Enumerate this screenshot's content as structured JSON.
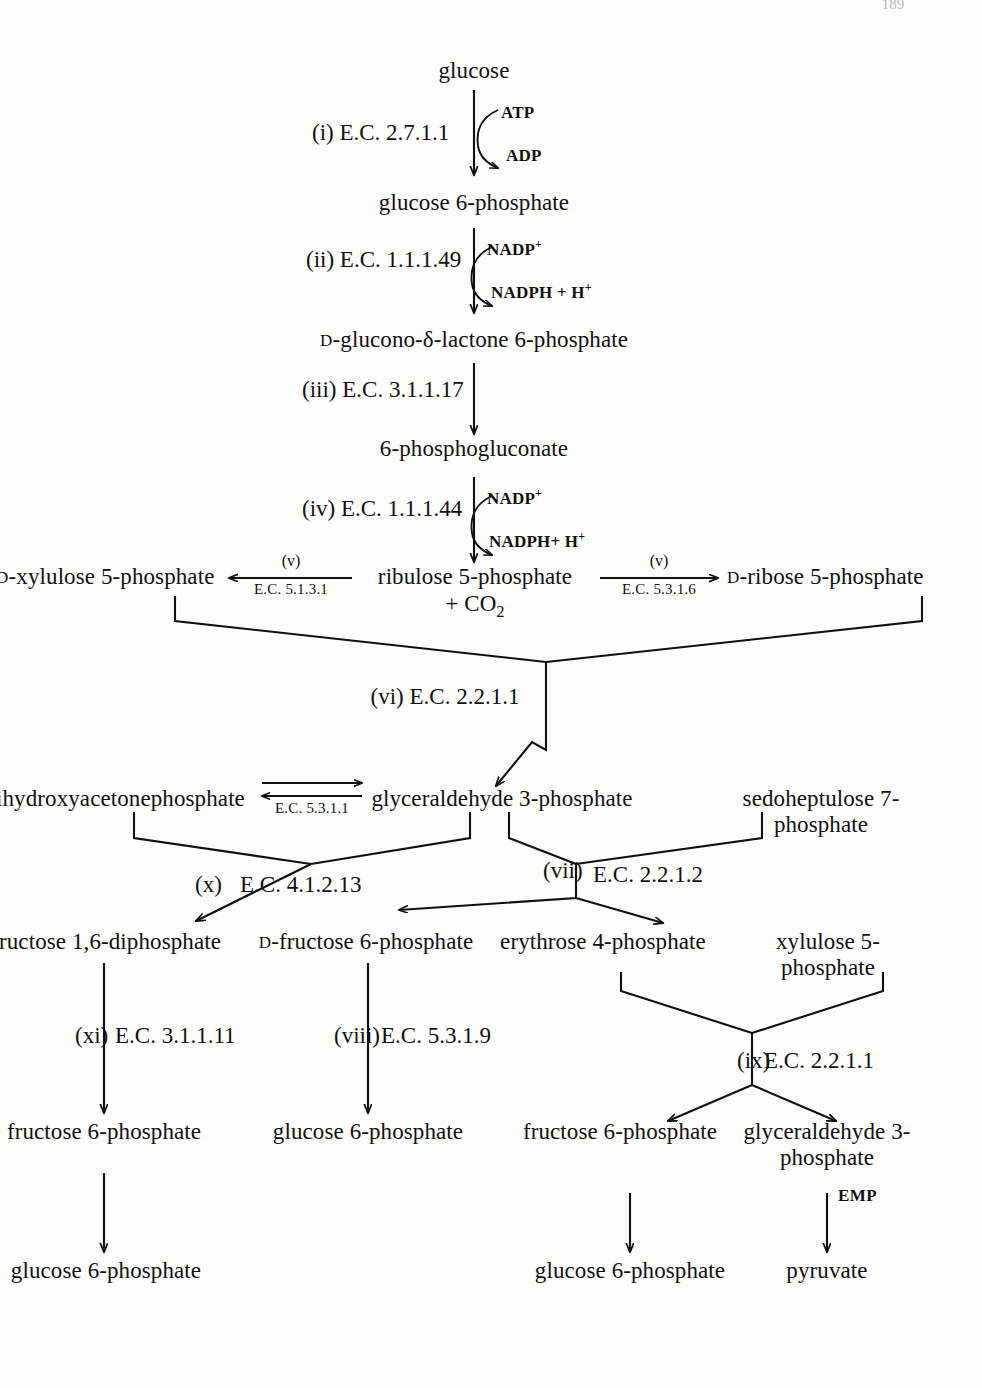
{
  "page": {
    "page_number": "189",
    "ink_color": "#101010",
    "paper_color": "#fdfdfc"
  },
  "metabolites": {
    "glucose": "glucose",
    "glucose_6_phosphate_1": "glucose 6-phosphate",
    "d_glucono_lactone": "-glucono-δ-lactone 6-phosphate",
    "phosphogluconate": "6-phosphogluconate",
    "ribulose_5_phosphate": "ribulose 5-phosphate",
    "co2": "+ CO",
    "co2_sub": "2",
    "xylulose_5_phosphate_left": "-xylulose 5-phosphate",
    "ribose_5_phosphate": "-ribose 5-phosphate",
    "dihydroxyacetonephosphate": "ihydroxyacetonephosphate",
    "glyceraldehyde_3_phosphate": "glyceraldehyde 3-phosphate",
    "sedoheptulose_7_phosphate": "sedoheptulose 7-phosphate",
    "fructose_1_6_diphosphate": "ructose 1,6-diphosphate",
    "d_fructose_6_phosphate": "-fructose 6-phosphate",
    "erythrose_4_phosphate": "erythrose 4-phosphate",
    "xylulose_5_phosphate_right": "xylulose 5-phosphate",
    "fructose_6_phosphate_left": "fructose 6-phosphate",
    "glucose_6_phosphate_mid": "glucose 6-phosphate",
    "fructose_6_phosphate_right": "fructose 6-phosphate",
    "glyceraldehyde_3_phosphate_2": "glyceraldehyde 3-phosphate",
    "glucose_6_phosphate_bottom_left": "glucose 6-phosphate",
    "glucose_6_phosphate_bottom_mid": "glucose 6-phosphate",
    "pyruvate": "pyruvate"
  },
  "stereo_prefix": "D",
  "steps": [
    {
      "roman": "(i)",
      "ec": "E.C. 2.7.1.1"
    },
    {
      "roman": "(ii)",
      "ec": "E.C. 1.1.1.49"
    },
    {
      "roman": "(iii)",
      "ec": "E.C. 3.1.1.17"
    },
    {
      "roman": "(iv)",
      "ec": "E.C. 1.1.1.44"
    },
    {
      "roman": "(v)",
      "ec": "E.C. 5.1.3.1"
    },
    {
      "roman": "(v)",
      "ec": "E.C. 5.3.1.6"
    },
    {
      "roman": "(vi)",
      "ec": "E.C. 2.2.1.1"
    },
    {
      "roman": "(vii)",
      "ec": "E.C. 2.2.1.2"
    },
    {
      "roman": "(viii)",
      "ec": "E.C. 5.3.1.9"
    },
    {
      "roman": "(ix)",
      "ec": "E.C. 2.2.1.1"
    },
    {
      "roman": "(x)",
      "ec": "E.C. 4.1.2.13"
    },
    {
      "roman": "(xi)",
      "ec": "E.C. 3.1.1.11"
    },
    {
      "roman": "",
      "ec": "E.C. 5.3.1.1"
    }
  ],
  "step_labels": {
    "i_roman": "(i)",
    "i_ec": "E.C. 2.7.1.1",
    "ii_roman": "(ii)",
    "ii_ec": "E.C. 1.1.1.49",
    "iii_roman": "(iii)",
    "iii_ec": "E.C. 3.1.1.17",
    "iv_roman": "(iv)",
    "iv_ec": "E.C. 1.1.1.44",
    "v_left_roman": "(v)",
    "v_left_ec": "E.C. 5.1.3.1",
    "v_right_roman": "(v)",
    "v_right_ec": "E.C. 5.3.1.6",
    "vi_roman": "(vi)",
    "vi_ec": "E.C. 2.2.1.1",
    "vii_roman": "(vii)",
    "vii_ec": "E.C. 2.2.1.2",
    "viii_roman": "(viii)",
    "viii_ec": "E.C. 5.3.1.9",
    "ix_roman": "(ix)",
    "ix_ec": "E.C. 2.2.1.1",
    "x_roman": "(x)",
    "x_ec": "E.C. 4.1.2.13",
    "xi_roman": "(xi)",
    "xi_ec": "E.C. 3.1.1.11",
    "tpi_ec": "E.C. 5.3.1.1"
  },
  "cofactors": {
    "atp": "ATP",
    "adp": "ADP",
    "nadp_1": "NADP",
    "nadph_1": "NADPH + H",
    "nadp_2": "NADP",
    "nadph_2": "NADPH+ H",
    "plus_charge": "+",
    "emp": "EMP"
  }
}
